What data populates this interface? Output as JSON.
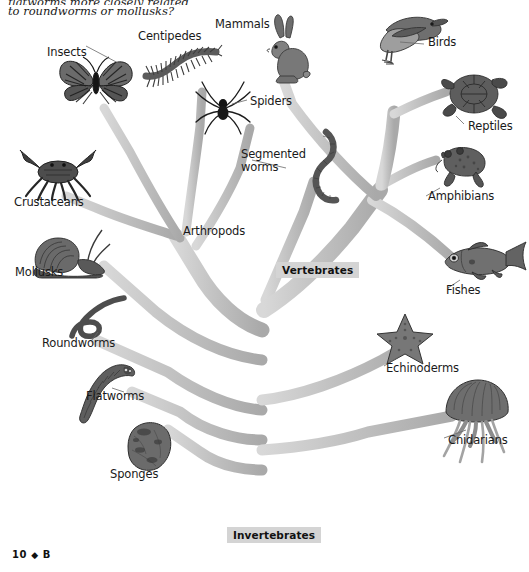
{
  "page": {
    "question_line1": "flatworms more closely related",
    "question_line2": "to roundworms or mollusks?",
    "page_number": "10",
    "page_diamond": "◆",
    "page_section": "B",
    "background": "#ffffff",
    "branch_color": "#bdbdbd",
    "label_box_color": "#d4d4d4",
    "text_color": "#1a1a1a"
  },
  "diagram": {
    "type": "phylogenetic-tree",
    "title_labels": [
      {
        "name": "vertebrates-group-label",
        "text": "Vertebrates",
        "x": 276,
        "y": 262
      },
      {
        "name": "invertebrates-group-label",
        "text": "Invertebrates",
        "x": 227,
        "y": 527
      }
    ],
    "taxa": [
      {
        "id": "insects",
        "label": "Insects",
        "icon": "butterfly-icon",
        "label_x": 47,
        "label_y": 46,
        "art_x": 56,
        "art_y": 52,
        "art_w": 80,
        "art_h": 58
      },
      {
        "id": "centipedes",
        "label": "Centipedes",
        "icon": "centipede-icon",
        "label_x": 138,
        "label_y": 30,
        "art_x": 140,
        "art_y": 42,
        "art_w": 80,
        "art_h": 46
      },
      {
        "id": "mammals",
        "label": "Mammals",
        "icon": "rabbit-icon",
        "label_x": 215,
        "label_y": 18,
        "art_x": 260,
        "art_y": 14,
        "art_w": 52,
        "art_h": 70
      },
      {
        "id": "birds",
        "label": "Birds",
        "icon": "bird-icon",
        "label_x": 428,
        "label_y": 36,
        "art_x": 362,
        "art_y": 10,
        "art_w": 84,
        "art_h": 62
      },
      {
        "id": "spiders",
        "label": "Spiders",
        "icon": "spider-icon",
        "label_x": 250,
        "label_y": 95,
        "art_x": 194,
        "art_y": 82,
        "art_w": 56,
        "art_h": 52
      },
      {
        "id": "reptiles",
        "label": "Reptiles",
        "icon": "turtle-icon",
        "label_x": 468,
        "label_y": 120,
        "art_x": 432,
        "art_y": 66,
        "art_w": 80,
        "art_h": 58
      },
      {
        "id": "segmented-worms",
        "label": "Segmented worms",
        "icon": "earthworm-icon",
        "label_x": 241,
        "label_y": 148,
        "art_x": 296,
        "art_y": 130,
        "art_w": 56,
        "art_h": 70
      },
      {
        "id": "crustaceans",
        "label": "Crustaceans",
        "icon": "crab-icon",
        "label_x": 14,
        "label_y": 196,
        "art_x": 18,
        "art_y": 144,
        "art_w": 78,
        "art_h": 56
      },
      {
        "id": "amphibians",
        "label": "Amphibians",
        "icon": "frog-icon",
        "label_x": 428,
        "label_y": 190,
        "art_x": 430,
        "art_y": 140,
        "art_w": 62,
        "art_h": 48
      },
      {
        "id": "arthropods",
        "label": "Arthropods",
        "icon": null,
        "label_x": 183,
        "label_y": 225,
        "art_x": null,
        "art_y": null,
        "art_w": 0,
        "art_h": 0
      },
      {
        "id": "mollusks",
        "label": "Mollusks",
        "icon": "snail-icon",
        "label_x": 15,
        "label_y": 266,
        "art_x": 26,
        "art_y": 228,
        "art_w": 84,
        "art_h": 52
      },
      {
        "id": "fishes",
        "label": "Fishes",
        "icon": "fish-icon",
        "label_x": 446,
        "label_y": 284,
        "art_x": 438,
        "art_y": 236,
        "art_w": 86,
        "art_h": 48
      },
      {
        "id": "roundworms",
        "label": "Roundworms",
        "icon": "roundworm-icon",
        "label_x": 42,
        "label_y": 337,
        "art_x": 70,
        "art_y": 296,
        "art_w": 56,
        "art_h": 46
      },
      {
        "id": "echinoderms",
        "label": "Echinoderms",
        "icon": "seastar-icon",
        "label_x": 386,
        "label_y": 362,
        "art_x": 374,
        "art_y": 312,
        "art_w": 60,
        "art_h": 52
      },
      {
        "id": "flatworms",
        "label": "Flatworms",
        "icon": "flatworm-icon",
        "label_x": 86,
        "label_y": 390,
        "art_x": 66,
        "art_y": 358,
        "art_w": 70,
        "art_h": 68
      },
      {
        "id": "cnidarians",
        "label": "Cnidarians",
        "icon": "jellyfish-icon",
        "label_x": 448,
        "label_y": 434,
        "art_x": 440,
        "art_y": 378,
        "art_w": 72,
        "art_h": 86
      },
      {
        "id": "sponges",
        "label": "Sponges",
        "icon": "sponge-icon",
        "label_x": 110,
        "label_y": 468,
        "art_x": 124,
        "art_y": 420,
        "art_w": 48,
        "art_h": 50
      }
    ]
  }
}
